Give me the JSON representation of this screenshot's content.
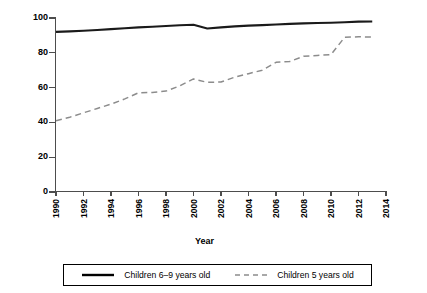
{
  "chart_data": {
    "type": "line",
    "title": "",
    "xlabel": "Year",
    "ylabel": "Percent of children attending school",
    "xlim": [
      1990,
      2014
    ],
    "ylim": [
      0,
      100
    ],
    "grid": false,
    "legend_position": "bottom",
    "x_tick_labels": [
      "1990",
      "1992",
      "1994",
      "1996",
      "1998",
      "2000",
      "2002",
      "2004",
      "2006",
      "2008",
      "2010",
      "2012",
      "2014"
    ],
    "y_tick_labels": [
      "0",
      "20",
      "40",
      "60",
      "80",
      "100"
    ],
    "y_ticks": [
      0,
      20,
      40,
      60,
      80,
      100
    ],
    "x": [
      1990,
      1991,
      1992,
      1993,
      1994,
      1995,
      1996,
      1997,
      1998,
      1999,
      2000,
      2001,
      2002,
      2003,
      2004,
      2005,
      2006,
      2007,
      2008,
      2009,
      2010,
      2011,
      2012,
      2013
    ],
    "series": [
      {
        "name": "Children 6–9 years old",
        "style": "solid",
        "color": "#1a1a1a",
        "values": [
          92.0,
          92.3,
          92.7,
          93.1,
          93.6,
          94.1,
          94.6,
          95.0,
          95.4,
          95.8,
          96.1,
          94.0,
          94.6,
          95.2,
          95.6,
          95.9,
          96.3,
          96.6,
          96.9,
          97.1,
          97.3,
          97.6,
          97.9,
          98.0
        ]
      },
      {
        "name": "Children 5 years old",
        "style": "dashed",
        "color": "#8c8c8c",
        "values": [
          41.0,
          43.0,
          45.5,
          48.0,
          50.5,
          53.5,
          57.0,
          57.2,
          58.0,
          61.0,
          65.0,
          63.0,
          63.2,
          66.0,
          68.0,
          70.0,
          74.5,
          75.0,
          78.0,
          78.5,
          79.0,
          89.0,
          89.2,
          89.0
        ]
      }
    ]
  },
  "legend": {
    "entries": [
      {
        "label": "Children 6–9 years old",
        "style": "solid"
      },
      {
        "label": "Children 5 years old",
        "style": "dashed"
      }
    ]
  }
}
